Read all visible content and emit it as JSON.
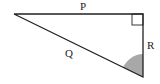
{
  "diagram": {
    "type": "right-triangle",
    "vertices": {
      "left": [
        14,
        14
      ],
      "right_angle": [
        143,
        14
      ],
      "bottom": [
        143,
        77
      ]
    },
    "labels": {
      "top_side": "P",
      "hypotenuse": "Q",
      "right_side": "R"
    },
    "right_angle_marker": true,
    "shaded_angle": "angle at bottom vertex between Q and R",
    "colors": {
      "stroke": "#222222",
      "shade": "#a8a8a8",
      "background": "#ffffff"
    }
  }
}
